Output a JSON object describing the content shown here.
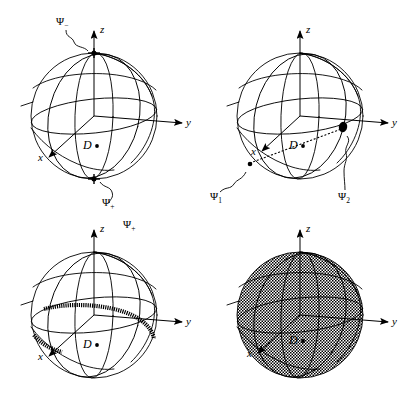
{
  "figure": {
    "type": "diagram",
    "background": "#ffffff",
    "ink": "#000000",
    "shade": "#b0b0b0"
  },
  "panels": [
    {
      "id": "panel-1",
      "index": 1,
      "axes": {
        "x": "x",
        "y": "y",
        "z": "z"
      },
      "center_label": "D",
      "annotations": [
        {
          "name": "psi-minus",
          "text": "Ψ",
          "sub": "−",
          "at": "north-pole"
        },
        {
          "name": "psi-plus",
          "text": "Ψ",
          "sub": "+",
          "at": "south-pole"
        }
      ]
    },
    {
      "id": "panel-2",
      "index": 2,
      "axes": {
        "x": "x",
        "y": "y",
        "z": "z"
      },
      "center_label": "D",
      "annotations": [
        {
          "name": "psi-1",
          "text": "Ψ",
          "sub": "1",
          "at": "lower-left-surface"
        },
        {
          "name": "psi-2",
          "text": "Ψ",
          "sub": "2",
          "at": "right-surface"
        }
      ],
      "chord": {
        "style": "dotted",
        "from": "psi-1",
        "through": "D",
        "to": "psi-2"
      }
    },
    {
      "id": "panel-3",
      "index": 3,
      "axes": {
        "x": "x",
        "y": "y",
        "z": "z"
      },
      "center_label": "D",
      "annotations": [
        {
          "name": "psi-plus",
          "text": "Ψ",
          "sub": "+",
          "at": "top-right-of-z-axis"
        }
      ],
      "highlight": {
        "name": "great-circle-band",
        "style": "thick-stippled-ring"
      }
    },
    {
      "id": "panel-4",
      "index": 4,
      "axes": {
        "x": "x",
        "y": "y",
        "z": "z"
      },
      "center_label": "D",
      "annotations": [],
      "highlight": {
        "name": "filled-sphere",
        "style": "uniform-stipple-shading"
      }
    }
  ],
  "labels": {
    "x": "x",
    "y": "y",
    "z": "z",
    "D": "D",
    "psi": "Ψ",
    "sub_minus": "−",
    "sub_plus": "+",
    "sub_1": "1",
    "sub_2": "2"
  }
}
